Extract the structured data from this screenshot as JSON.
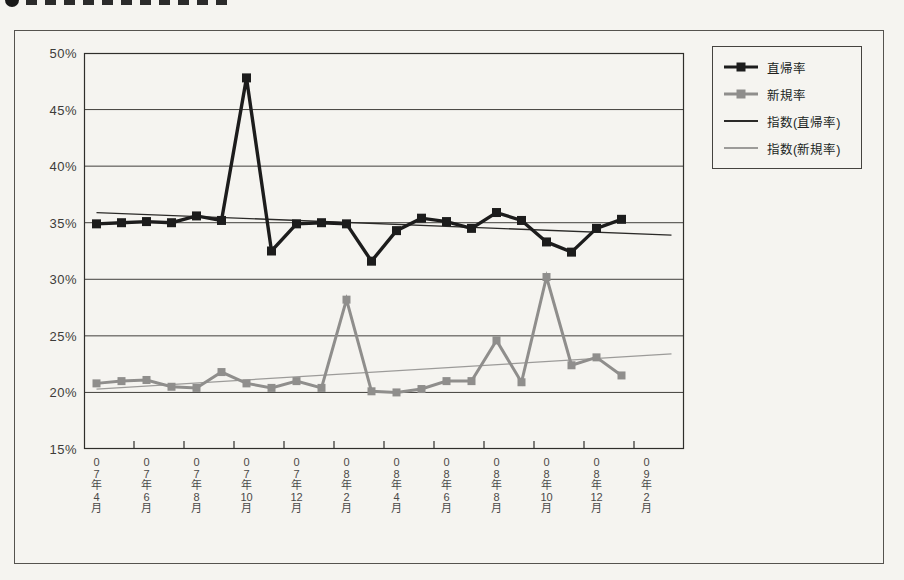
{
  "page": {
    "background": "#f5f4f0"
  },
  "chart_data": {
    "type": "line",
    "title": "",
    "legend_position": "right",
    "grid": {
      "color": "#403f3c",
      "border_color": "#2f2e2b",
      "grid_on": true
    },
    "y_axis": {
      "min": 15,
      "max": 50,
      "step": 5,
      "unit": "%",
      "tick_labels": [
        "50%",
        "45%",
        "40%",
        "35%",
        "30%",
        "25%",
        "20%",
        "15%"
      ]
    },
    "x_axis": {
      "slots": 24,
      "tick_labels": [
        "07年4月",
        "07年6月",
        "07年8月",
        "07年10月",
        "07年12月",
        "08年2月",
        "08年4月",
        "08年6月",
        "08年8月",
        "08年10月",
        "08年12月",
        "09年2月"
      ]
    },
    "categories": [
      "07年4月",
      "07年5月",
      "07年6月",
      "07年7月",
      "07年8月",
      "07年9月",
      "07年10月",
      "07年11月",
      "07年12月",
      "08年1月",
      "08年2月",
      "08年3月",
      "08年4月",
      "08年5月",
      "08年6月",
      "08年7月",
      "08年8月",
      "08年9月",
      "08年10月",
      "08年11月",
      "08年12月",
      "09年1月"
    ],
    "series": [
      {
        "name": "直帰率",
        "type": "line-marker",
        "color": "#1c1c1c",
        "line_width": 3.4,
        "marker": "square",
        "marker_size": 9,
        "values": [
          34.9,
          35.0,
          35.1,
          35.0,
          35.6,
          35.2,
          47.8,
          32.5,
          34.9,
          35.0,
          34.9,
          31.6,
          34.3,
          35.4,
          35.1,
          34.5,
          35.9,
          35.2,
          33.3,
          32.4,
          34.5,
          35.3
        ]
      },
      {
        "name": "新規率",
        "type": "line-marker",
        "color": "#8f8e8c",
        "line_width": 3,
        "marker": "square",
        "marker_size": 8,
        "values": [
          20.8,
          21.0,
          21.1,
          20.5,
          20.4,
          21.8,
          20.8,
          20.4,
          21.0,
          20.4,
          28.2,
          20.1,
          20.0,
          20.3,
          21.0,
          21.0,
          24.6,
          20.9,
          30.2,
          22.4,
          23.1,
          21.5
        ]
      },
      {
        "name": "指数(直帰率)",
        "type": "trendline",
        "color": "#2b2a28",
        "line_width": 1.3,
        "start": 35.9,
        "end": 33.9
      },
      {
        "name": "指数(新規率)",
        "type": "trendline",
        "color": "#9c9b99",
        "line_width": 1.3,
        "start": 20.3,
        "end": 23.4
      }
    ]
  },
  "legend": {
    "items": [
      {
        "label": "直帰率",
        "swatch": "line-marker",
        "color": "#1c1c1c",
        "line_height": 3
      },
      {
        "label": "新規率",
        "swatch": "line-marker",
        "color": "#8f8e8c",
        "line_height": 3
      },
      {
        "label": "指数(直帰率)",
        "swatch": "line",
        "color": "#2b2a28",
        "line_height": 2
      },
      {
        "label": "指数(新規率)",
        "swatch": "line",
        "color": "#9c9b99",
        "line_height": 2
      }
    ]
  }
}
